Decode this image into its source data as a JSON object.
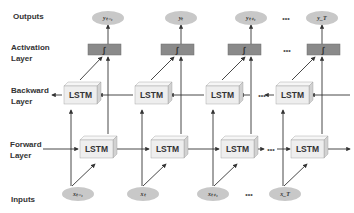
{
  "diagram": {
    "row_labels": {
      "outputs": "Outputs",
      "activation_1": "Activation",
      "activation_2": "Layer",
      "backward_1": "Backward",
      "backward_2": "Layer",
      "forward_1": "Forward",
      "forward_2": "Layer",
      "inputs": "Inputs"
    },
    "lstm_label": "LSTM",
    "activation_symbol": "∫",
    "ellipsis": "•••",
    "outputs": [
      "yₜ₋₁",
      "yₜ",
      "yₜ₊₁",
      "yₜ"
    ],
    "output_labels": [
      "yₜ₋₁",
      "yₜ",
      "yₜ₊₁",
      "y_T"
    ],
    "inputs": [
      "xₜ₋₁",
      "xₜ",
      "xₜ₊₁",
      "x_T"
    ],
    "colors": {
      "ellipse_fill": "#c8c8c8",
      "activation_fill": "#8a8a8a",
      "lstm_front": "#eeeeee",
      "lstm_top": "#f6f6f6",
      "lstm_side": "#d2d2d2",
      "line": "#333333"
    }
  }
}
